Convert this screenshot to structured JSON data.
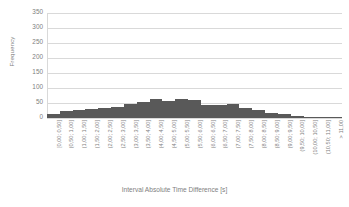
{
  "chart_data": {
    "type": "bar",
    "title": "",
    "xlabel": "Interval Absolute Time Difference [s]",
    "ylabel": "Frequency",
    "ylim": [
      0,
      350
    ],
    "yticks": [
      0,
      50,
      100,
      150,
      200,
      250,
      300,
      350
    ],
    "grid": true,
    "legend": false,
    "bar_color": "#595959",
    "grid_color": "#d9d9d9",
    "text_color": "#808080",
    "categories": [
      "[0,00; 0,50]",
      "(0,50; 1,00]",
      "(1,00; 1,50]",
      "(1,50; 2,00]",
      "(2,00; 2,50]",
      "(2,50; 3,00]",
      "(3,00; 3,50]",
      "(3,50; 4,00]",
      "(4,00; 4,50]",
      "(4,50; 5,00]",
      "(5,00; 5,50]",
      "(5,50; 6,00]",
      "(6,00; 6,50]",
      "(6,50; 7,00]",
      "(7,00; 7,50]",
      "(7,50; 8,00]",
      "(8,00; 8,50]",
      "(8,50; 9,00]",
      "(9,00; 9,50]",
      "(9,50; 10,00]",
      "(10,00; 10,50]",
      "(10,50; 11,00]",
      "> 11,00"
    ],
    "values": [
      14,
      22,
      26,
      31,
      33,
      36,
      46,
      53,
      62,
      58,
      62,
      61,
      44,
      42,
      46,
      33,
      26,
      18,
      13,
      8,
      5,
      3,
      2
    ]
  }
}
